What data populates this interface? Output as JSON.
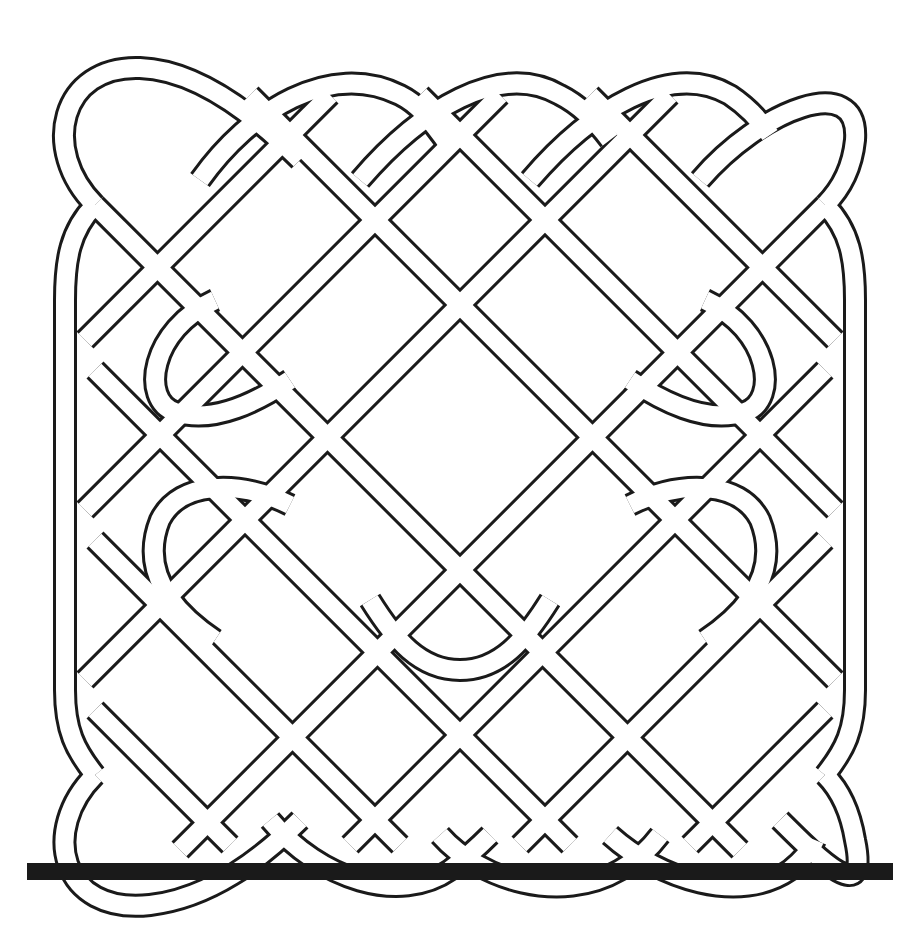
{
  "image": {
    "title": "Celtic knot square pattern",
    "description": "Black and white interlaced Celtic knotwork square with a solid black bar beneath it",
    "colors": {
      "line": "#1a1a1a",
      "background": "#ffffff",
      "bar": "#1a1a1a"
    }
  }
}
